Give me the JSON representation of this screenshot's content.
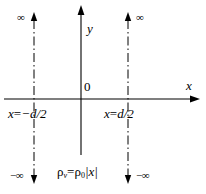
{
  "figure": {
    "type": "coordinate-diagram",
    "width": 206,
    "height": 194,
    "background_color": "#ffffff",
    "line_color": "#000000"
  },
  "axes": {
    "x_label": "x",
    "y_label": "y",
    "origin_label": "0",
    "x_axis_y_px": 99,
    "y_axis_x_px": 81,
    "x_axis_arrow": "right",
    "y_axis_arrow": "up"
  },
  "boundaries": [
    {
      "id": "left-plane",
      "label": "x=−d/2",
      "label_parts": {
        "variable": "x",
        "equals": "=",
        "value": "−d/2"
      },
      "x_px": 34,
      "style": "dash-dot",
      "top_arrow": "up",
      "bottom_arrow": "down",
      "top_label": "∞",
      "bottom_label": "−∞",
      "top_label_side": "left",
      "bottom_label_side": "left"
    },
    {
      "id": "right-plane",
      "label": "x=d/2",
      "label_parts": {
        "variable": "x",
        "equals": "=",
        "value": "d/2"
      },
      "x_px": 128,
      "style": "dash-dot",
      "top_arrow": "up",
      "bottom_arrow": "down",
      "top_label": "∞",
      "bottom_label": "−∞",
      "top_label_side": "right",
      "bottom_label_side": "right"
    }
  ],
  "equation": {
    "full": "ρv=ρ0|x|",
    "lhs_symbol": "ρ",
    "lhs_subscript": "v",
    "equals": "=",
    "rhs_symbol": "ρ",
    "rhs_subscript": "0",
    "rhs_expression": "|x|"
  },
  "infinity_labels": {
    "top_left": "∞",
    "top_right": "∞",
    "bottom_left": "−∞",
    "bottom_right": "−∞"
  }
}
